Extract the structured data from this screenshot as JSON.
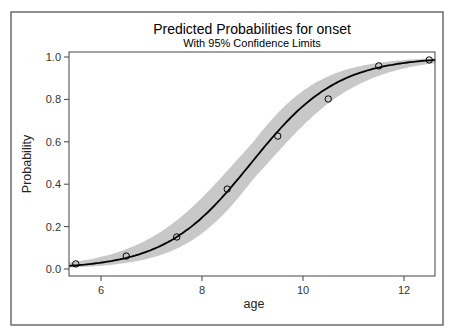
{
  "chart_data": {
    "type": "line",
    "title": "Predicted Probabilities for onset",
    "subtitle": "With 95% Confidence Limits",
    "xlabel": "age",
    "ylabel": "Probability",
    "xlim": [
      5.37,
      12.63
    ],
    "ylim": [
      -0.03,
      1.025
    ],
    "x_ticks": [
      6,
      8,
      10,
      12
    ],
    "x_tick_labels": [
      "6",
      "8",
      "10",
      "12"
    ],
    "y_ticks": [
      0.0,
      0.2,
      0.4,
      0.6,
      0.8,
      1.0
    ],
    "y_tick_labels": [
      "0.0",
      "0.2",
      "0.4",
      "0.6",
      "0.8",
      "1.0"
    ],
    "grid": false,
    "legend": null,
    "series": [
      {
        "name": "Observed proportion",
        "kind": "scatter",
        "marker": "open-circle",
        "x": [
          5.5,
          6.5,
          7.5,
          8.5,
          9.5,
          10.5,
          11.5,
          12.5
        ],
        "values": [
          0.024,
          0.061,
          0.151,
          0.377,
          0.627,
          0.802,
          0.958,
          0.986
        ]
      },
      {
        "name": "Predicted probability (logistic fit)",
        "kind": "line",
        "intercept": -10.5,
        "slope": 1.17,
        "color": "#000000"
      },
      {
        "name": "95% confidence band",
        "kind": "band",
        "color": "#c8c8c8"
      }
    ]
  },
  "colors": {
    "fit_line": "#000000",
    "band": "#c8c8c8",
    "frame": "#444444",
    "background": "#ffffff"
  }
}
